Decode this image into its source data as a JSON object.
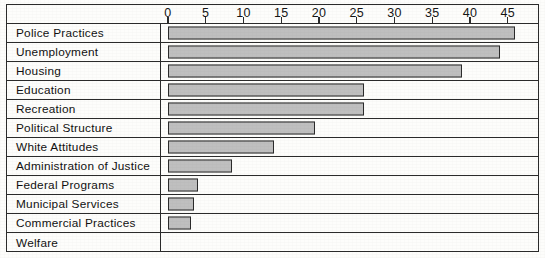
{
  "chart_data": {
    "type": "bar",
    "orientation": "horizontal",
    "title": "",
    "subtitle": "",
    "xlabel": "",
    "ylabel": "",
    "xlim": [
      0,
      46
    ],
    "ylim": null,
    "grid": false,
    "legend": null,
    "axis_ticks": [
      0,
      5,
      10,
      15,
      20,
      25,
      30,
      35,
      40,
      45
    ],
    "tick_labels": [
      "0",
      "5",
      "10",
      "15",
      "20",
      "25",
      "30",
      "35",
      "40",
      "45"
    ],
    "categories": [
      "Police Practices",
      "Unemployment",
      "Housing",
      "Education",
      "Recreation",
      "Political Structure",
      "White Attitudes",
      "Administration of Justice",
      "Federal Programs",
      "Municipal Services",
      "Commercial Practices",
      "Welfare"
    ],
    "values": [
      46,
      44,
      39,
      26,
      26,
      19.5,
      14,
      8.5,
      4,
      3.5,
      3,
      0
    ],
    "bar_fill_color": "#bfbfbf",
    "bar_border_color": "#2b2b2b",
    "frame_color": "#2b2b2b",
    "background_color": "#fdfdfb"
  }
}
